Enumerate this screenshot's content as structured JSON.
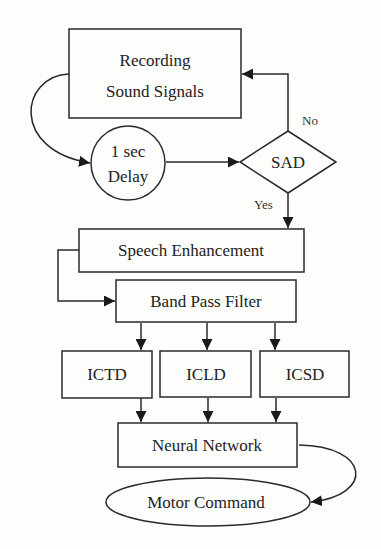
{
  "diagram": {
    "type": "flowchart",
    "nodes": {
      "recording": {
        "id": "recording",
        "shape": "rectangle",
        "line1": "Recording",
        "line2": "Sound Signals"
      },
      "delay": {
        "id": "delay",
        "shape": "circle",
        "line1": "1 sec",
        "line2": "Delay"
      },
      "sad": {
        "id": "sad",
        "shape": "diamond",
        "label": "SAD"
      },
      "speech_enhancement": {
        "id": "speech_enhancement",
        "shape": "rectangle",
        "label": "Speech Enhancement"
      },
      "band_pass_filter": {
        "id": "band_pass_filter",
        "shape": "rectangle",
        "label": "Band Pass Filter"
      },
      "ictd": {
        "id": "ictd",
        "shape": "rectangle",
        "label": "ICTD"
      },
      "icld": {
        "id": "icld",
        "shape": "rectangle",
        "label": "ICLD"
      },
      "icsd": {
        "id": "icsd",
        "shape": "rectangle",
        "label": "ICSD"
      },
      "neural_network": {
        "id": "neural_network",
        "shape": "rectangle",
        "label": "Neural Network"
      },
      "motor_command": {
        "id": "motor_command",
        "shape": "ellipse",
        "label": "Motor Command"
      }
    },
    "edges": [
      {
        "from": "recording",
        "to": "delay",
        "label": ""
      },
      {
        "from": "delay",
        "to": "sad",
        "label": ""
      },
      {
        "from": "sad",
        "to": "recording",
        "label": "No"
      },
      {
        "from": "sad",
        "to": "speech_enhancement",
        "label": "Yes"
      },
      {
        "from": "speech_enhancement",
        "to": "band_pass_filter",
        "label": ""
      },
      {
        "from": "band_pass_filter",
        "to": "ictd",
        "label": ""
      },
      {
        "from": "band_pass_filter",
        "to": "icld",
        "label": ""
      },
      {
        "from": "band_pass_filter",
        "to": "icsd",
        "label": ""
      },
      {
        "from": "ictd",
        "to": "neural_network",
        "label": ""
      },
      {
        "from": "icld",
        "to": "neural_network",
        "label": ""
      },
      {
        "from": "icsd",
        "to": "neural_network",
        "label": ""
      },
      {
        "from": "neural_network",
        "to": "motor_command",
        "label": ""
      }
    ],
    "edge_labels": {
      "no": "No",
      "yes": "Yes"
    }
  }
}
